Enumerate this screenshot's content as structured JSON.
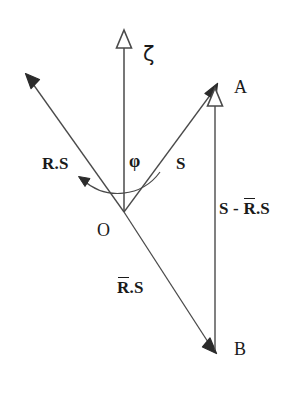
{
  "diagram": {
    "background_color": "#ffffff",
    "stroke_color": "#4a4a4a",
    "text_color": "#1a1a1a",
    "points": {
      "origin": {
        "label": "O",
        "x": 124,
        "y": 212
      },
      "a": {
        "label": "A",
        "x": 215,
        "y": 88
      },
      "b": {
        "label": "B",
        "x": 215,
        "y": 350
      },
      "axis_tip": {
        "x": 124,
        "y": 30
      },
      "rs_tip": {
        "x": 28,
        "y": 78
      }
    },
    "axis": {
      "name": "zeta-axis",
      "symbol": "ζ",
      "arrowhead": "hollow-triangle",
      "label_x": 145,
      "label_y": 46
    },
    "angle": {
      "symbol": "φ",
      "label_x": 129,
      "label_y": 153,
      "from": "S",
      "to": "R.S",
      "arc_direction": "counter-clockwise"
    },
    "vectors": [
      {
        "name": "r-dot-s",
        "label_main": "R",
        "label_rest": ".S",
        "overbar": false,
        "from": "O",
        "to": "rs_tip",
        "arrowhead": "solid",
        "label_x": 42,
        "label_y": 157
      },
      {
        "name": "s",
        "label_main": "S",
        "label_rest": "",
        "overbar": false,
        "from": "O",
        "to": "A",
        "arrowhead": "solid",
        "label_x": 176,
        "label_y": 157
      },
      {
        "name": "rbar-dot-s",
        "label_main": "R",
        "label_rest": ".S",
        "overbar": true,
        "from": "O",
        "to": "B",
        "arrowhead": "solid",
        "label_x": 117,
        "label_y": 281
      },
      {
        "name": "s-minus-rbar-dot-s",
        "label_prefix": "S - ",
        "label_main": "R",
        "label_rest": ".S",
        "overbar": true,
        "from": "B",
        "to": "A",
        "arrowhead": "hollow-triangle",
        "label_x": 222,
        "label_y": 202
      }
    ],
    "point_labels": [
      {
        "name": "point-label-a",
        "text": "A",
        "x": 234,
        "y": 79
      },
      {
        "name": "point-label-o",
        "text": "O",
        "x": 98,
        "y": 222
      },
      {
        "name": "point-label-b",
        "text": "B",
        "x": 234,
        "y": 341
      }
    ]
  }
}
